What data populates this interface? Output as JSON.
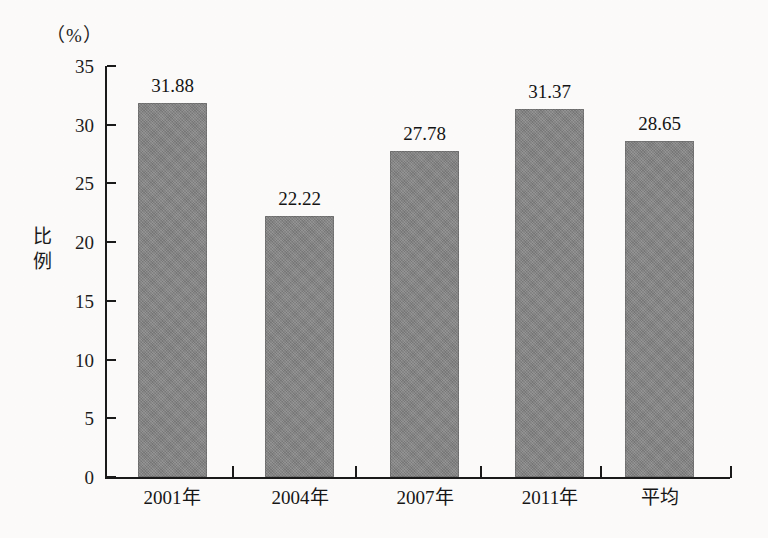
{
  "chart_data": {
    "type": "bar",
    "title": "",
    "subtitle": "",
    "unit_label": "（%）",
    "xlabel": "",
    "ylabel": "比例",
    "categories": [
      "2001年",
      "2004年",
      "2007年",
      "2011年",
      "平均"
    ],
    "values": [
      31.88,
      22.22,
      27.78,
      31.37,
      28.65
    ],
    "value_labels": [
      "31.88",
      "22.22",
      "27.78",
      "31.37",
      "28.65"
    ],
    "series": [
      {
        "name": "比例",
        "values": [
          31.88,
          22.22,
          27.78,
          31.37,
          28.65
        ]
      }
    ],
    "ylim": [
      0,
      35
    ],
    "yticks": [
      0,
      5,
      10,
      15,
      20,
      25,
      30,
      35
    ],
    "ytick_labels": [
      "0",
      "5",
      "10",
      "15",
      "20",
      "25",
      "30",
      "35"
    ],
    "grid": false,
    "legend": false,
    "legend_position": "none",
    "bar_color": "#878787",
    "axis_color": "#1a1a1a",
    "background_color": "#fdfcfb"
  },
  "axis": {
    "y_title_chars": [
      "比",
      "例"
    ],
    "unit": "（%）"
  }
}
